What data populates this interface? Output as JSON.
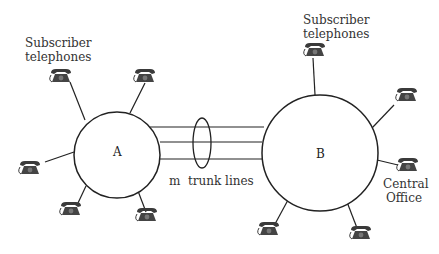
{
  "diagram": {
    "type": "telephone-network",
    "nodes": [
      {
        "id": "A",
        "label": "A",
        "cx": 117,
        "cy": 155,
        "r": 43
      },
      {
        "id": "B",
        "label": "B",
        "cx": 320,
        "cy": 153,
        "r": 58
      }
    ],
    "labels": {
      "subscriber_left_line1": "Subscriber",
      "subscriber_left_line2": "telephones",
      "subscriber_right_line1": "Subscriber",
      "subscriber_right_line2": "telephones",
      "trunk": "m  trunk lines",
      "central_line1": "Central",
      "central_line2": "Office"
    },
    "trunk_lines": 3,
    "phones_per_node": {
      "A": 5,
      "B": 5
    },
    "colors": {
      "stroke": "#222222",
      "phone": "#3a3a3a",
      "text": "#333333"
    }
  }
}
